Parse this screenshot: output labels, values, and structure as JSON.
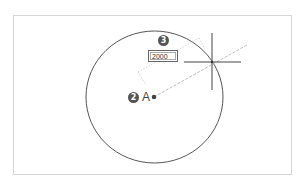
{
  "diagram": {
    "center_point": {
      "label": "A",
      "step_marker": "2"
    },
    "radius_input": {
      "value": "2000",
      "step_marker": "3"
    },
    "colors": {
      "frame": "#d6d6d6",
      "circle": "#555555",
      "crosshair": "#444444",
      "rubber_band_line": "#bdbdbd",
      "dimension_line": "#cccccc",
      "marker_fill": "#555555",
      "marker_text": "#ffffff"
    }
  }
}
